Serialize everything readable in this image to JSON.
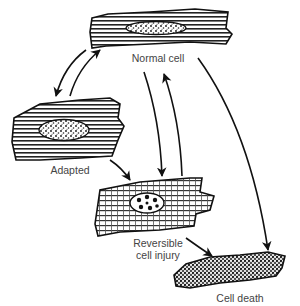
{
  "diagram": {
    "type": "cell-state-flow",
    "nodes": [
      {
        "id": "normal",
        "label": "Normal cell"
      },
      {
        "id": "adapted",
        "label": "Adapted"
      },
      {
        "id": "reversible",
        "label_line1": "Reversible",
        "label_line2": "cell injury"
      },
      {
        "id": "death",
        "label": "Cell death"
      }
    ],
    "edges": [
      {
        "from": "normal",
        "to": "adapted"
      },
      {
        "from": "adapted",
        "to": "normal"
      },
      {
        "from": "adapted",
        "to": "reversible"
      },
      {
        "from": "normal",
        "to": "reversible"
      },
      {
        "from": "reversible",
        "to": "normal"
      },
      {
        "from": "reversible",
        "to": "death"
      },
      {
        "from": "normal",
        "to": "death"
      }
    ],
    "colors": {
      "ink": "#111111",
      "label": "#444444",
      "background": "#ffffff"
    }
  }
}
